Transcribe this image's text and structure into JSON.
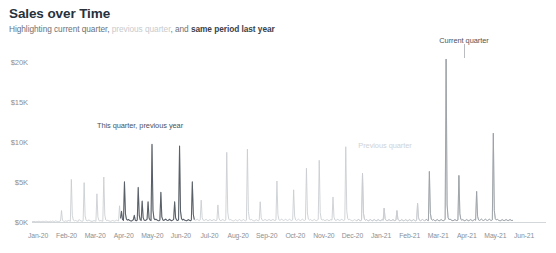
{
  "header": {
    "title": "Sales over Time",
    "subtitle_parts": [
      {
        "text": "Highlighting current quarter, ",
        "style": "normal"
      },
      {
        "text": "previous quarter",
        "style": "dim"
      },
      {
        "text": ", and ",
        "style": "normal"
      },
      {
        "text": "same period last year",
        "style": "strong"
      }
    ]
  },
  "annotations": [
    {
      "name": "current-quarter",
      "text": "Current quarter",
      "x": 464,
      "y": 36,
      "style": "dark",
      "leader_x": 464,
      "leader_y": 44,
      "leader_h": 14
    },
    {
      "name": "previous-quarter",
      "text": "Previous quarter",
      "x": 385,
      "y": 141,
      "style": "light",
      "leader_x": 0,
      "leader_y": 0,
      "leader_h": 0
    },
    {
      "name": "this-quarter-previous-year",
      "text": "This quarter, previous year",
      "x": 140,
      "y": 121,
      "style": "dark",
      "leader_x": 0,
      "leader_y": 0,
      "leader_h": 0
    }
  ],
  "colors": {
    "line_default": "#c9ccd0",
    "line_highlight": "#5a6068",
    "line_current": "#9ba0a6",
    "axis": "#d4d7da",
    "tick_text": "#8a9096",
    "title_text": "#28313b"
  },
  "chart_data": {
    "type": "line",
    "title": "Sales over Time",
    "subtitle": "Highlighting current quarter, previous quarter, and same period last year",
    "xlabel": "",
    "ylabel": "",
    "ylim": [
      0,
      21000
    ],
    "grid": false,
    "legend": "none",
    "ytick_labels": [
      "$0K",
      "$5K",
      "$10K",
      "$15K",
      "$20K"
    ],
    "ytick_values": [
      0,
      5000,
      10000,
      15000,
      20000
    ],
    "xtick_labels": [
      "Jan-20",
      "Feb-20",
      "Mar-20",
      "Apr-20",
      "May-20",
      "Jun-20",
      "Jul-20",
      "Aug-20",
      "Sep-20",
      "Oct-20",
      "Nov-20",
      "Dec-20",
      "Jan-21",
      "Feb-21",
      "Mar-21",
      "Apr-21",
      "May-21",
      "Jun-21"
    ],
    "highlight_segments": [
      {
        "name": "same period last year",
        "start_index": 90,
        "end_index": 165,
        "color": "#5a6068"
      },
      {
        "name": "previous quarter",
        "start_index": 330,
        "end_index": 400,
        "color": "#c9ccd0"
      },
      {
        "name": "current quarter",
        "start_index": 400,
        "end_index": 490,
        "color": "#9ba0a6"
      }
    ],
    "x": [
      0,
      1,
      2,
      3,
      4,
      5,
      6,
      7,
      8,
      9,
      10,
      11,
      12,
      13,
      14,
      15,
      16,
      17,
      18,
      19,
      20,
      21,
      22,
      23,
      24,
      25,
      26,
      27,
      28,
      29,
      30,
      31,
      32,
      33,
      34,
      35,
      36,
      37,
      38,
      39,
      40,
      41,
      42,
      43,
      44,
      45,
      46,
      47,
      48,
      49,
      50,
      51,
      52,
      53,
      54,
      55,
      56,
      57,
      58,
      59,
      60,
      61,
      62,
      63,
      64,
      65,
      66,
      67,
      68,
      69,
      70,
      71,
      72,
      73,
      74,
      75,
      76,
      77,
      78,
      79,
      80,
      81,
      82,
      83,
      84,
      85,
      86,
      87,
      88,
      89,
      90,
      91,
      92,
      93,
      94,
      95,
      96,
      97,
      98,
      99,
      100,
      101,
      102,
      103,
      104,
      105,
      106,
      107,
      108,
      109,
      110,
      111,
      112,
      113,
      114,
      115,
      116,
      117,
      118,
      119,
      120,
      121,
      122,
      123,
      124,
      125,
      126,
      127,
      128,
      129,
      130,
      131,
      132,
      133,
      134,
      135,
      136,
      137,
      138,
      139,
      140,
      141,
      142,
      143,
      144,
      145,
      146,
      147,
      148,
      149,
      150,
      151,
      152,
      153,
      154,
      155,
      156,
      157,
      158,
      159,
      160,
      161,
      162,
      163,
      164,
      165,
      166,
      167,
      168,
      169,
      170,
      171,
      172,
      173,
      174,
      175,
      176,
      177,
      178,
      179,
      180,
      181,
      182,
      183,
      184,
      185,
      186,
      187,
      188,
      189,
      190,
      191,
      192,
      193,
      194,
      195,
      196,
      197,
      198,
      199,
      200,
      201,
      202,
      203,
      204,
      205,
      206,
      207,
      208,
      209,
      210,
      211,
      212,
      213,
      214,
      215,
      216,
      217,
      218,
      219,
      220,
      221,
      222,
      223,
      224,
      225,
      226,
      227,
      228,
      229,
      230,
      231,
      232,
      233,
      234,
      235,
      236,
      237,
      238,
      239,
      240,
      241,
      242,
      243,
      244,
      245,
      246,
      247,
      248,
      249,
      250,
      251,
      252,
      253,
      254,
      255,
      256,
      257,
      258,
      259,
      260,
      261,
      262,
      263,
      264,
      265,
      266,
      267,
      268,
      269,
      270,
      271,
      272,
      273,
      274,
      275,
      276,
      277,
      278,
      279,
      280,
      281,
      282,
      283,
      284,
      285,
      286,
      287,
      288,
      289,
      290,
      291,
      292,
      293,
      294,
      295,
      296,
      297,
      298,
      299,
      300,
      301,
      302,
      303,
      304,
      305,
      306,
      307,
      308,
      309,
      310,
      311,
      312,
      313,
      314,
      315,
      316,
      317,
      318,
      319,
      320,
      321,
      322,
      323,
      324,
      325,
      326,
      327,
      328,
      329,
      330,
      331,
      332,
      333,
      334,
      335,
      336,
      337,
      338,
      339,
      340,
      341,
      342,
      343,
      344,
      345,
      346,
      347,
      348,
      349,
      350,
      351,
      352,
      353,
      354,
      355,
      356,
      357,
      358,
      359,
      360,
      361,
      362,
      363,
      364,
      365,
      366,
      367,
      368,
      369,
      370,
      371,
      372,
      373,
      374,
      375,
      376,
      377,
      378,
      379,
      380,
      381,
      382,
      383,
      384,
      385,
      386,
      387,
      388,
      389,
      390,
      391,
      392,
      393,
      394,
      395,
      396,
      397,
      398,
      399,
      400,
      401,
      402,
      403,
      404,
      405,
      406,
      407,
      408,
      409,
      410,
      411,
      412,
      413,
      414,
      415,
      416,
      417,
      418,
      419,
      420,
      421,
      422,
      423,
      424,
      425,
      426,
      427,
      428,
      429,
      430,
      431,
      432,
      433,
      434,
      435,
      436,
      437,
      438,
      439,
      440,
      441,
      442,
      443,
      444,
      445,
      446,
      447,
      448,
      449,
      450,
      451,
      452,
      453,
      454,
      455,
      456,
      457,
      458,
      459,
      460,
      461,
      462,
      463,
      464,
      465,
      466,
      467,
      468,
      469,
      470,
      471,
      472,
      473,
      474,
      475,
      476,
      477,
      478,
      479,
      480,
      481,
      482,
      483,
      484,
      485,
      486,
      487,
      488,
      489
    ],
    "values": [
      120,
      90,
      140,
      110,
      80,
      130,
      100,
      160,
      120,
      90,
      110,
      150,
      130,
      100,
      170,
      140,
      110,
      90,
      130,
      160,
      120,
      180,
      140,
      110,
      200,
      160,
      130,
      110,
      150,
      190,
      1500,
      260,
      180,
      140,
      210,
      170,
      140,
      320,
      190,
      150,
      5400,
      900,
      300,
      200,
      260,
      210,
      170,
      140,
      380,
      240,
      190,
      150,
      210,
      5000,
      820,
      280,
      200,
      260,
      320,
      210,
      170,
      140,
      190,
      240,
      200,
      160,
      3600,
      700,
      260,
      200,
      250,
      190,
      160,
      5700,
      950,
      320,
      230,
      280,
      220,
      180,
      150,
      200,
      260,
      210,
      170,
      230,
      290,
      240,
      190,
      2100,
      520,
      1400,
      380,
      260,
      5100,
      1100,
      420,
      300,
      380,
      280,
      220,
      190,
      260,
      340,
      900,
      280,
      220,
      300,
      4400,
      880,
      340,
      260,
      2700,
      620,
      300,
      240,
      320,
      400,
      2600,
      560,
      300,
      240,
      9800,
      1500,
      520,
      340,
      420,
      320,
      260,
      220,
      300,
      3800,
      700,
      320,
      260,
      340,
      420,
      300,
      240,
      320,
      400,
      280,
      230,
      300,
      380,
      2600,
      600,
      300,
      250,
      330,
      9600,
      1400,
      480,
      320,
      400,
      300,
      250,
      210,
      280,
      360,
      280,
      230,
      300,
      5100,
      1000,
      360,
      280,
      340,
      420,
      300,
      240,
      320,
      2800,
      620,
      300,
      240,
      320,
      400,
      280,
      230,
      300,
      380,
      280,
      230,
      300,
      380,
      280,
      230,
      300,
      2200,
      560,
      280,
      230,
      300,
      380,
      280,
      230,
      300,
      8800,
      1300,
      440,
      300,
      380,
      280,
      230,
      200,
      270,
      350,
      270,
      220,
      290,
      370,
      270,
      220,
      290,
      370,
      270,
      220,
      290,
      9200,
      1400,
      460,
      310,
      390,
      290,
      240,
      200,
      270,
      350,
      270,
      220,
      290,
      2600,
      600,
      290,
      240,
      310,
      390,
      290,
      240,
      310,
      390,
      290,
      240,
      310,
      390,
      290,
      240,
      310,
      5200,
      1000,
      350,
      270,
      340,
      420,
      300,
      250,
      330,
      410,
      300,
      250,
      330,
      410,
      300,
      250,
      330,
      4100,
      800,
      330,
      260,
      340,
      420,
      300,
      250,
      330,
      410,
      300,
      250,
      330,
      6800,
      1200,
      420,
      300,
      380,
      280,
      230,
      300,
      380,
      280,
      230,
      300,
      380,
      7800,
      1250,
      430,
      300,
      380,
      280,
      230,
      300,
      380,
      280,
      230,
      300,
      380,
      280,
      3200,
      680,
      310,
      250,
      330,
      410,
      300,
      250,
      330,
      410,
      300,
      250,
      330,
      9500,
      1450,
      470,
      320,
      400,
      300,
      250,
      210,
      280,
      360,
      280,
      230,
      300,
      380,
      280,
      230,
      300,
      6200,
      1150,
      400,
      290,
      370,
      270,
      220,
      290,
      370,
      270,
      220,
      290,
      370,
      270,
      220,
      290,
      370,
      270,
      220,
      290,
      370,
      270,
      1800,
      480,
      270,
      220,
      290,
      370,
      270,
      220,
      290,
      370,
      270,
      220,
      290,
      1500,
      420,
      260,
      210,
      280,
      360,
      260,
      210,
      280,
      360,
      260,
      210,
      280,
      360,
      260,
      210,
      280,
      360,
      260,
      210,
      280,
      2400,
      560,
      280,
      230,
      300,
      380,
      280,
      230,
      300,
      380,
      280,
      230,
      6400,
      1150,
      400,
      290,
      370,
      270,
      220,
      290,
      370,
      270,
      220,
      290,
      370,
      270,
      220,
      290,
      370,
      20500,
      2200,
      600,
      360,
      440,
      320,
      260,
      220,
      290,
      370,
      280,
      230,
      300,
      5900,
      1100,
      390,
      290,
      370,
      270,
      220,
      290,
      370,
      270,
      220,
      290,
      370,
      270,
      220,
      290,
      370,
      270,
      3900,
      780,
      320,
      260,
      340,
      420,
      300,
      250,
      330,
      410,
      300,
      250,
      330,
      410,
      300,
      250,
      330,
      11200,
      1500,
      480,
      320,
      400,
      300,
      250,
      210,
      280,
      360,
      280,
      230,
      300,
      380,
      280,
      230,
      300,
      380,
      280,
      230,
      300
    ]
  }
}
